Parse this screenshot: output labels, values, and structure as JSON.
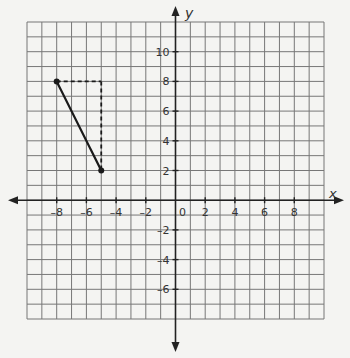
{
  "chart_data": {
    "type": "line",
    "title": "",
    "xlabel": "x",
    "ylabel": "y",
    "xlim": [
      -10,
      10
    ],
    "ylim": [
      -8,
      12
    ],
    "grid": true,
    "x_ticks": [
      -8,
      -6,
      -4,
      -2,
      0,
      2,
      4,
      6,
      8
    ],
    "y_ticks": [
      -6,
      -4,
      -2,
      2,
      4,
      6,
      8,
      10
    ],
    "x_tick_labels": [
      "–8",
      "–6",
      "–4",
      "–2",
      "0",
      "2",
      "4",
      "6",
      "8"
    ],
    "y_tick_labels": [
      "–6",
      "–4",
      "–2",
      "2",
      "4",
      "6",
      "8",
      "10"
    ],
    "series": [
      {
        "name": "segment",
        "style": "solid",
        "points": [
          [
            -8,
            8
          ],
          [
            -5,
            2
          ]
        ]
      },
      {
        "name": "horizontal-leg",
        "style": "dashed",
        "points": [
          [
            -8,
            8
          ],
          [
            -5,
            8
          ]
        ]
      },
      {
        "name": "vertical-leg",
        "style": "dashed",
        "points": [
          [
            -5,
            8
          ],
          [
            -5,
            2
          ]
        ]
      }
    ],
    "points": [
      [
        -8,
        8
      ],
      [
        -5,
        2
      ]
    ]
  },
  "axis_labels": {
    "x": "x",
    "y": "y"
  },
  "colors": {
    "grid": "#777777",
    "axis": "#222222",
    "line": "#1a1a1a",
    "background": "#f4f4f2"
  }
}
